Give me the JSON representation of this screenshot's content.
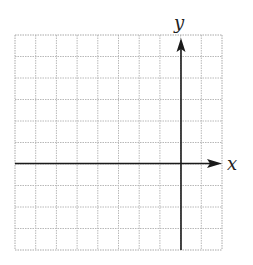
{
  "chart_data": {
    "type": "coordinate-grid",
    "title": "",
    "xlabel": "x",
    "ylabel": "y",
    "grid": true,
    "columns": 10,
    "rows": 10,
    "y_axis_column_index": 8,
    "x_axis_row_index": 6,
    "xlim": [
      -8,
      2
    ],
    "ylim": [
      -4,
      6
    ],
    "series": []
  },
  "axes": {
    "x_label": "x",
    "y_label": "y"
  },
  "colors": {
    "grid": "#b8b8b8",
    "border": "#a8a8a8",
    "axis": "#1a1a1a"
  }
}
